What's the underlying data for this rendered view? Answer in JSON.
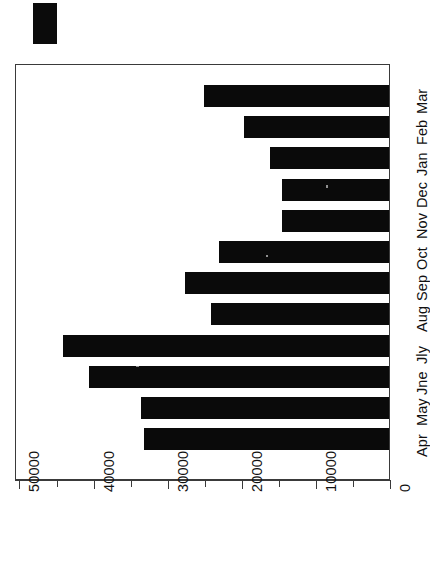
{
  "chart_data": {
    "type": "bar",
    "orientation": "horizontal-rotated",
    "title": "",
    "subtitle": "",
    "xlabel": "",
    "ylabel": "",
    "categories": [
      "Apr",
      "May",
      "Jne",
      "Jly",
      "Aug",
      "Sep",
      "Oct",
      "Nov",
      "Dec",
      "Jan",
      "Feb",
      "Mar"
    ],
    "values": [
      33000,
      33500,
      40500,
      44000,
      24000,
      27500,
      23000,
      14500,
      14500,
      16000,
      19500,
      25000
    ],
    "series": [
      {
        "name": "",
        "values": [
          33000,
          33500,
          40500,
          44000,
          24000,
          27500,
          23000,
          14500,
          14500,
          16000,
          19500,
          25000
        ],
        "color": "#0a0a0a"
      }
    ],
    "value_axis": {
      "ticks": [
        0,
        10000,
        20000,
        30000,
        40000,
        50000
      ],
      "tick_labels": [
        "0",
        "10000",
        "20000",
        "30000",
        "40000",
        "50000"
      ],
      "minor_tick_step": 5000,
      "lim": [
        0,
        50600
      ]
    },
    "grid": false,
    "legend": {
      "position": "top-left",
      "entries": [
        {
          "label": "",
          "color": "#0a0a0a",
          "marker": "filled-rectangle"
        }
      ]
    },
    "annotations": []
  },
  "figure": {
    "background_color": "#ffffff",
    "frame_color": "#3a3a3a",
    "bar_color": "#0a0a0a",
    "plot_rotated_90": true
  },
  "legend_swatch": {
    "name": "legend-swatch",
    "color": "#0a0a0a"
  }
}
